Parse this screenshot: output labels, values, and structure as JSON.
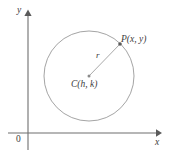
{
  "figure": {
    "background_color": "#ffffff",
    "axis_color": "#6f6f6f",
    "curve_color": "#9a9a9a",
    "label_color": "#3c3c3c"
  },
  "axes": {
    "y_label": "y",
    "x_label": "x",
    "origin_label": "0",
    "origin": {
      "x": 28,
      "y": 133
    },
    "y_axis": {
      "x": 28,
      "y_top": 12,
      "y_bottom": 150,
      "arrow": "up"
    },
    "x_axis": {
      "y": 133,
      "x_left": 8,
      "x_right": 160,
      "arrow": "right"
    }
  },
  "circle": {
    "center": {
      "x": 89,
      "y": 76
    },
    "radius": 45,
    "center_label": "C(h, k)",
    "center_point_label": "C",
    "center_coords": "(h, k)"
  },
  "radius": {
    "label": "r",
    "from": {
      "x": 89,
      "y": 76
    },
    "to": {
      "x": 120,
      "y": 44
    }
  },
  "point": {
    "label": "P(x, y)",
    "point_name": "P",
    "coords": "(x, y)",
    "position": {
      "x": 120,
      "y": 44
    }
  }
}
